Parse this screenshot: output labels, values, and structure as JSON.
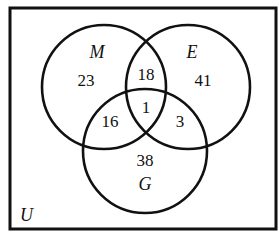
{
  "diagram": {
    "type": "venn-3",
    "universe_label": "U",
    "sets": [
      {
        "id": "M",
        "label": "M"
      },
      {
        "id": "E",
        "label": "E"
      },
      {
        "id": "G",
        "label": "G"
      }
    ],
    "regions": {
      "M_only": "23",
      "E_only": "41",
      "G_only": "38",
      "M_and_E_only": "18",
      "M_and_G_only": "16",
      "E_and_G_only": "3",
      "M_and_E_and_G": "1"
    },
    "stroke_color": "#111111",
    "background_color": "#ffffff"
  }
}
